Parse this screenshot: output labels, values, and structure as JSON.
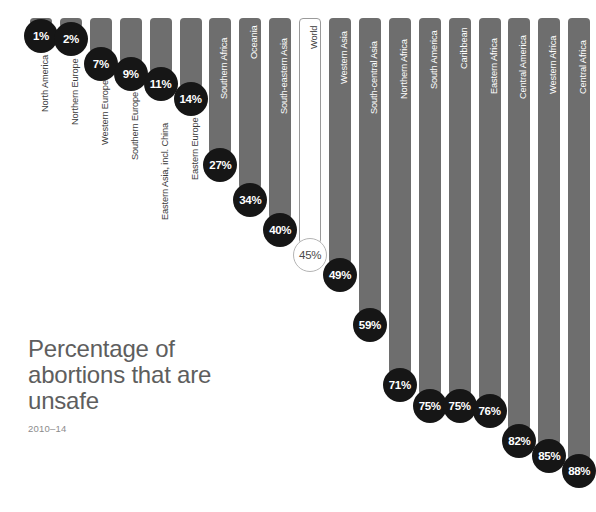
{
  "chart_data": {
    "type": "bar",
    "title": "Percentage of abortions that are unsafe",
    "subtitle": "2010–14",
    "xlabel": "",
    "ylabel": "",
    "ylim": [
      0,
      100
    ],
    "grid": false,
    "legend": "none",
    "orientation": "vertical-descending",
    "unit": "%",
    "categories": [
      "North America",
      "Northern Europe",
      "Western Europe",
      "Southern Europe",
      "Eastern Asia, incl. China",
      "Eastern Europe",
      "Southern Africa",
      "Oceania",
      "South-eastern Asia",
      "World",
      "Western Asia",
      "South-central Asia",
      "Northern Africa",
      "South America",
      "Caribbean",
      "Eastern Africa",
      "Central America",
      "Western Africa",
      "Central Africa"
    ],
    "values": [
      1,
      2,
      7,
      9,
      11,
      14,
      27,
      34,
      40,
      45,
      49,
      59,
      71,
      75,
      75,
      76,
      82,
      85,
      88
    ],
    "value_labels": [
      "1%",
      "2%",
      "7%",
      "9%",
      "11%",
      "14%",
      "27%",
      "34%",
      "40%",
      "45%",
      "49%",
      "59%",
      "71%",
      "75%",
      "75%",
      "76%",
      "82%",
      "85%",
      "88%"
    ],
    "highlighted_category": "World",
    "colors": {
      "bar": "#6e6e6e",
      "bar_highlight": "#ffffff",
      "bar_highlight_border": "#9a9a9a",
      "bubble": "#161616",
      "bubble_text": "#ffffff",
      "bubble_highlight": "#ffffff",
      "bubble_highlight_text": "#4a4a4a",
      "title_text": "#5e5e5e",
      "subtitle_text": "#8c8c8c",
      "label_inside": "#ffffff",
      "label_outside": "#3a3a3a",
      "background": "#ffffff"
    }
  }
}
